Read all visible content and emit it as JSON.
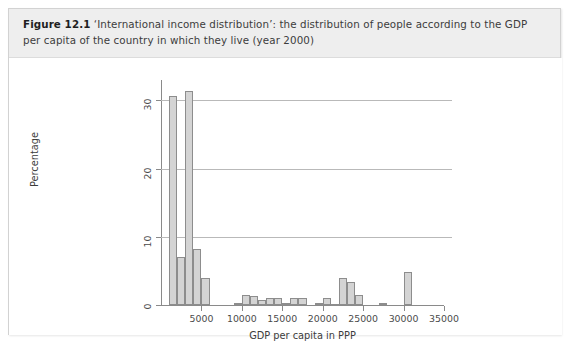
{
  "figure": {
    "label": "Figure 12.1",
    "caption": "‘International income distribution’: the distribution of people according to the GDP per capita of the country in which they live (year 2000)"
  },
  "colors": {
    "caption_band": "#eeeeee",
    "bar_fill": "#d4d4d4",
    "bar_stroke": "#8d8d8d",
    "axis": "#8a8a8a",
    "gridline": "#b9b9b9",
    "page_background": "#ffffff"
  },
  "chart_data": {
    "type": "bar",
    "title": "",
    "xlabel": "GDP per capita in PPP",
    "ylabel": "Percentage",
    "xlim": [
      0,
      35000
    ],
    "ylim": [
      0,
      33
    ],
    "grid": true,
    "legend": false,
    "xticks": [
      5000,
      10000,
      15000,
      20000,
      25000,
      30000,
      35000
    ],
    "xtick_labels": [
      "5000",
      "10000",
      "15000",
      "20000",
      "25000",
      "30000",
      "35000"
    ],
    "yticks": [
      0,
      10,
      20,
      30
    ],
    "ytick_labels": [
      "0",
      "10",
      "20",
      "30"
    ],
    "gridlines_at": [
      10,
      20,
      30
    ],
    "bin_width": 1000,
    "bars": [
      {
        "x0": 1000,
        "x1": 2000,
        "value": 30.7
      },
      {
        "x0": 2000,
        "x1": 3000,
        "value": 7.0
      },
      {
        "x0": 3000,
        "x1": 4000,
        "value": 31.4
      },
      {
        "x0": 4000,
        "x1": 5000,
        "value": 8.2
      },
      {
        "x0": 5000,
        "x1": 6000,
        "value": 4.0
      },
      {
        "x0": 9000,
        "x1": 10000,
        "value": 0.3
      },
      {
        "x0": 10000,
        "x1": 11000,
        "value": 1.4
      },
      {
        "x0": 11000,
        "x1": 12000,
        "value": 1.3
      },
      {
        "x0": 12000,
        "x1": 13000,
        "value": 0.8
      },
      {
        "x0": 13000,
        "x1": 14000,
        "value": 1.0
      },
      {
        "x0": 14000,
        "x1": 15000,
        "value": 1.0
      },
      {
        "x0": 15000,
        "x1": 16000,
        "value": 0.25
      },
      {
        "x0": 16000,
        "x1": 17000,
        "value": 1.1
      },
      {
        "x0": 17000,
        "x1": 18000,
        "value": 1.0
      },
      {
        "x0": 19000,
        "x1": 20000,
        "value": 0.3
      },
      {
        "x0": 20000,
        "x1": 21000,
        "value": 1.0
      },
      {
        "x0": 21000,
        "x1": 22000,
        "value": 0.2
      },
      {
        "x0": 22000,
        "x1": 23000,
        "value": 3.9
      },
      {
        "x0": 23000,
        "x1": 24000,
        "value": 3.4
      },
      {
        "x0": 24000,
        "x1": 25000,
        "value": 1.4
      },
      {
        "x0": 27000,
        "x1": 28000,
        "value": 0.35
      },
      {
        "x0": 30000,
        "x1": 31000,
        "value": 4.8
      }
    ]
  }
}
